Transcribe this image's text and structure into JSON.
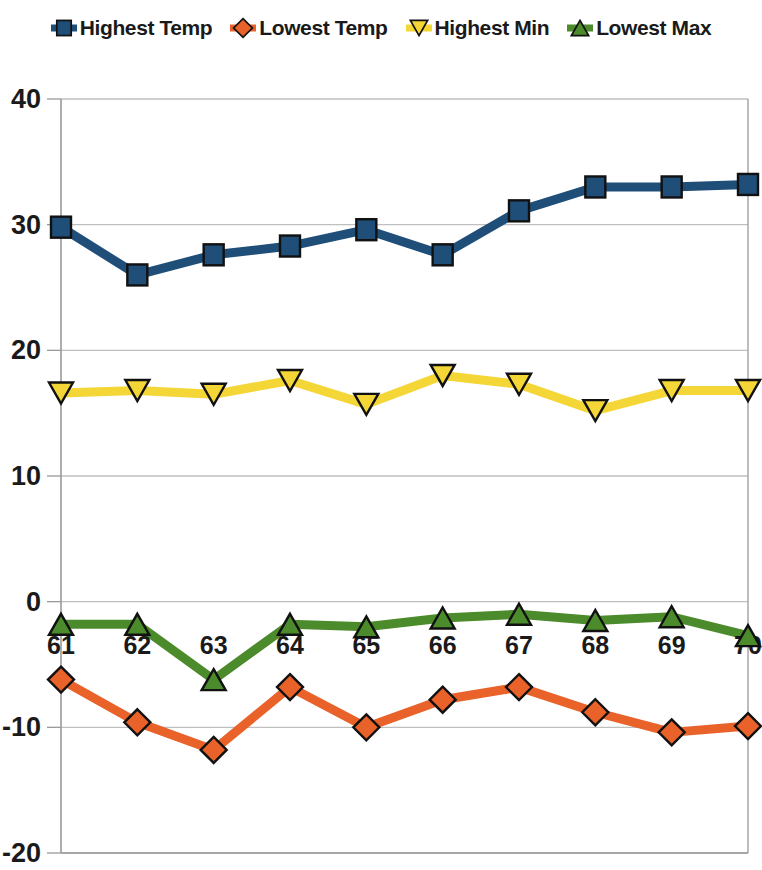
{
  "legend": {
    "position": "top-center",
    "items": [
      {
        "label": "Highest Temp",
        "color": "#1F4E79",
        "marker": "square",
        "marker_icon": "square-marker-icon"
      },
      {
        "label": "Lowest Temp",
        "color": "#E8622A",
        "marker": "diamond",
        "marker_icon": "diamond-marker-icon"
      },
      {
        "label": "Highest Min",
        "color": "#F5D637",
        "marker": "triangle-down",
        "marker_icon": "triangle-down-marker-icon"
      },
      {
        "label": "Lowest Max",
        "color": "#4C8B2B",
        "marker": "triangle-up",
        "marker_icon": "triangle-up-marker-icon"
      }
    ]
  },
  "axes": {
    "y_ticks": [
      "40",
      "30",
      "20",
      "10",
      "0",
      "-10",
      "-20"
    ],
    "x_ticks": [
      "61",
      "62",
      "63",
      "64",
      "65",
      "66",
      "67",
      "68",
      "69",
      "70"
    ],
    "y_min": -20,
    "y_max": 40,
    "y_step": 10,
    "grid": "horizontal"
  },
  "chart_data": {
    "type": "line",
    "title": "",
    "xlabel": "",
    "ylabel": "",
    "ylim": [
      -20,
      40
    ],
    "grid": true,
    "legend_position": "top",
    "categories": [
      "61",
      "62",
      "63",
      "64",
      "65",
      "66",
      "67",
      "68",
      "69",
      "70"
    ],
    "series": [
      {
        "name": "Highest Temp",
        "color": "#1F4E79",
        "marker": "square",
        "values": [
          29.8,
          26.0,
          27.6,
          28.3,
          29.6,
          27.6,
          31.1,
          33.0,
          33.0,
          33.2
        ]
      },
      {
        "name": "Lowest Temp",
        "color": "#E8622A",
        "marker": "diamond",
        "values": [
          -6.2,
          -9.6,
          -11.8,
          -6.8,
          -10.0,
          -7.8,
          -6.8,
          -8.8,
          -10.4,
          -9.9
        ]
      },
      {
        "name": "Highest Min",
        "color": "#F5D637",
        "marker": "triangle-down",
        "values": [
          16.6,
          16.8,
          16.5,
          17.6,
          15.7,
          18.0,
          17.3,
          15.2,
          16.8,
          16.8
        ]
      },
      {
        "name": "Lowest Max",
        "color": "#4C8B2B",
        "marker": "triangle-up",
        "values": [
          -1.8,
          -1.8,
          -6.2,
          -1.8,
          -2.0,
          -1.3,
          -1.0,
          -1.5,
          -1.2,
          -2.7
        ]
      }
    ]
  },
  "plot_geometry": {
    "left": 61,
    "right": 748,
    "top": 99,
    "bottom": 853
  },
  "colors": {
    "grid": "#BFBFBF",
    "axis": "#9A9A9A",
    "background": "#FFFFFF",
    "marker_outline": "#111111"
  }
}
